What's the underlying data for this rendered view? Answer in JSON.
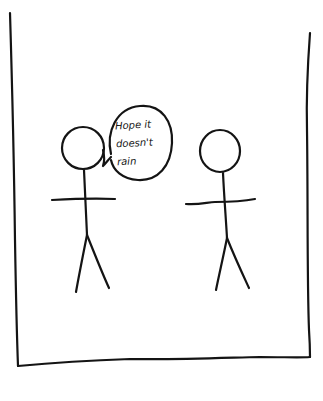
{
  "comic": {
    "panel": {
      "border_color": "#141414",
      "background": "#ffffff"
    },
    "characters": [
      {
        "name": "left-stick-figure",
        "role": "speaker"
      },
      {
        "name": "right-stick-figure",
        "role": "listener"
      }
    ],
    "speech_bubble": {
      "speaker": "left-stick-figure",
      "lines": [
        "Hope it",
        "doesn't",
        "rain"
      ]
    }
  }
}
